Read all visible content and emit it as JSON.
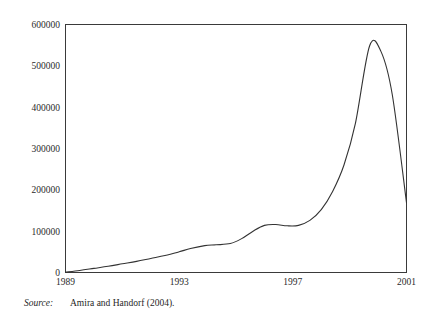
{
  "chart_data": {
    "type": "line",
    "title": "",
    "subtitle": "",
    "xlabel": "",
    "ylabel": "",
    "xlim": [
      1989,
      2001
    ],
    "ylim": [
      0,
      600000
    ],
    "grid": false,
    "legend": null,
    "x_ticks": [
      "1989",
      "1993",
      "1997",
      "2001"
    ],
    "x_tick_values": [
      1989,
      1993,
      1997,
      2001
    ],
    "y_ticks": [
      "0",
      "100000",
      "200000",
      "300000",
      "400000",
      "500000",
      "600000"
    ],
    "y_tick_values": [
      0,
      100000,
      200000,
      300000,
      400000,
      500000,
      600000
    ],
    "series": [
      {
        "name": "series-1",
        "color": "#333333",
        "x": [
          1989,
          1989.5,
          1990,
          1990.5,
          1991,
          1991.5,
          1992,
          1992.5,
          1993,
          1993.4,
          1993.9,
          1994.3,
          1994.8,
          1995.2,
          1995.6,
          1996,
          1996.4,
          1996.8,
          1997.2,
          1997.6,
          1998,
          1998.4,
          1998.8,
          1999.2,
          1999.7,
          2000.1,
          2000.5,
          2001
        ],
        "y": [
          1000,
          5000,
          10000,
          15000,
          21000,
          27000,
          34000,
          41000,
          50000,
          58000,
          65000,
          67000,
          70000,
          82000,
          100000,
          114000,
          116000,
          113000,
          114000,
          126000,
          152000,
          196000,
          260000,
          360000,
          548000,
          535000,
          430000,
          169000
        ]
      }
    ],
    "annotations": []
  },
  "footer": {
    "source_label": "Source:",
    "source_text": "Amira and Handorf (2004)."
  }
}
